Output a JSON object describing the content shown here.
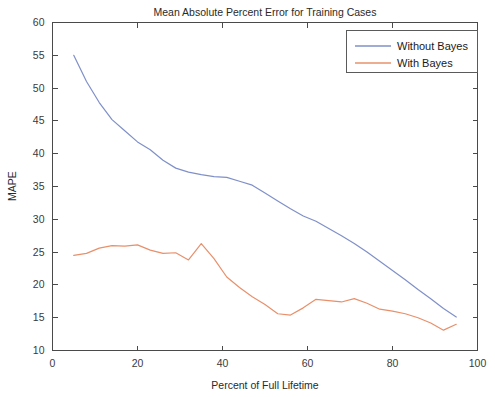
{
  "chart_data": {
    "type": "line",
    "title": "Mean Absolute Percent Error for Training Cases",
    "xlabel": "Percent of Full Lifetime",
    "ylabel": "MAPE",
    "xlim": [
      0,
      100
    ],
    "ylim": [
      10,
      60
    ],
    "xticks": [
      0,
      20,
      40,
      60,
      80,
      100
    ],
    "yticks": [
      10,
      15,
      20,
      25,
      30,
      35,
      40,
      45,
      50,
      55,
      60
    ],
    "xticklabels": [
      "0",
      "20",
      "40",
      "60",
      "80",
      "100"
    ],
    "yticklabels": [
      "10",
      "15",
      "20",
      "25",
      "30",
      "35",
      "40",
      "45",
      "50",
      "55",
      "60"
    ],
    "grid": false,
    "legend_position": "top-right",
    "x": [
      5,
      8,
      11,
      14,
      17,
      20,
      23,
      26,
      29,
      32,
      35,
      38,
      41,
      44,
      47,
      50,
      53,
      56,
      59,
      62,
      65,
      68,
      71,
      74,
      77,
      80,
      83,
      86,
      89,
      92,
      95
    ],
    "series": [
      {
        "name": "Without Bayes",
        "color": "#7f90c9",
        "values": [
          55.0,
          51.0,
          47.8,
          45.2,
          43.5,
          41.8,
          40.6,
          39.0,
          37.8,
          37.2,
          36.8,
          36.5,
          36.4,
          35.8,
          35.2,
          34.0,
          32.8,
          31.6,
          30.5,
          29.7,
          28.6,
          27.5,
          26.3,
          25.0,
          23.6,
          22.2,
          20.8,
          19.3,
          17.9,
          16.4,
          15.1
        ]
      },
      {
        "name": "With Bayes",
        "color": "#e8906b",
        "values": [
          24.5,
          24.8,
          25.6,
          26.0,
          25.9,
          26.1,
          25.3,
          24.8,
          24.9,
          23.8,
          26.3,
          24.0,
          21.2,
          19.6,
          18.2,
          17.0,
          15.6,
          15.4,
          16.5,
          17.8,
          17.6,
          17.4,
          17.9,
          17.2,
          16.3,
          16.0,
          15.6,
          15.0,
          14.2,
          13.1,
          14.0
        ]
      }
    ],
    "legend": [
      {
        "label": "Without Bayes",
        "color": "#7f90c9"
      },
      {
        "label": "With Bayes",
        "color": "#e8906b"
      }
    ]
  }
}
